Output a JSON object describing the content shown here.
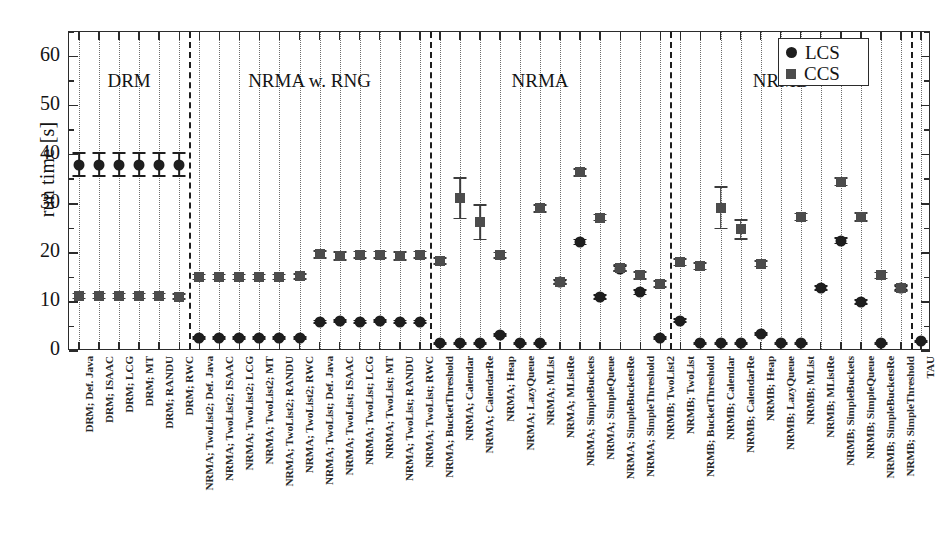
{
  "chart_data": {
    "type": "scatter",
    "title": "",
    "xlabel": "",
    "ylabel": "run time [s]",
    "ylim": [
      0,
      65
    ],
    "ytick_values": [
      0,
      10,
      20,
      30,
      40,
      50,
      60
    ],
    "ytick_labels": [
      "0",
      "10",
      "20",
      "30",
      "40",
      "50",
      "60"
    ],
    "yminor_step": 5,
    "grid": "vertical dotted per category",
    "legend_position": "top right",
    "legend": [
      {
        "name": "LCS",
        "marker": "circle",
        "color": "#1e1e1e"
      },
      {
        "name": "CCS",
        "marker": "square",
        "color": "#4c4c4c"
      }
    ],
    "group_labels": [
      "DRM",
      "NRMA w. RNG",
      "NRMA",
      "NRMB"
    ],
    "group_separator_after_index": [
      5,
      17,
      29
    ],
    "categories": [
      "DRM; Def. Java",
      "DRM; ISAAC",
      "DRM; LCG",
      "DRM; MT",
      "DRM; RANDU",
      "DRM; RWC",
      "NRMA; TwoList2; Def. Java",
      "NRMA; TwoList2; ISAAC",
      "NRMA; TwoList2; LCG",
      "NRMA; TwoList2; MT",
      "NRMA; TwoList2; RANDU",
      "NRMA; TwoList2; RWC",
      "NRMA; TwoList; Def. Java",
      "NRMA; TwoList; ISAAC",
      "NRMA; TwoList; LCG",
      "NRMA; TwoList; MT",
      "NRMA; TwoList; RANDU",
      "NRMA; TwoList; RWC",
      "NRMA; BucketThreshold",
      "NRMA; Calendar",
      "NRMA; CalendarRe",
      "NRMA; Heap",
      "NRMA; LazyQueue",
      "NRMA; MList",
      "NRMA; MListRe",
      "NRMA; SimpleBuckets",
      "NRMA; SimpleQueue",
      "NRMA; SimpleBucketsRe",
      "NRMA; SimpleThreshold",
      "NRMB; TwoList2",
      "NRMB; TwoList",
      "NRMB; BucketThreshold",
      "NRMB; Calendar",
      "NRMB; CalendarRe",
      "NRMB; Heap",
      "NRMB; LazyQueue",
      "NRMB; MList",
      "NRMB; MListRe",
      "NRMB; SimpleBuckets",
      "NRMB; SimpleQueue",
      "NRMB; SimpleBucketsRe",
      "NRMB; SimpleThreshold",
      "TAU"
    ],
    "series": [
      {
        "name": "LCS",
        "marker": "circle",
        "values": [
          38,
          38,
          38,
          38,
          38,
          38,
          2.6,
          2.6,
          2.6,
          2.6,
          2.6,
          2.6,
          6.0,
          6.1,
          6.0,
          6.1,
          6.0,
          6.0,
          1.6,
          1.6,
          1.6,
          3.3,
          1.6,
          1.6,
          14.1,
          22.2,
          11.0,
          16.8,
          12.0,
          2.7,
          6.2,
          1.6,
          1.6,
          1.6,
          3.5,
          1.6,
          1.6,
          12.9,
          22.5,
          10.0,
          1.6,
          12.8,
          2.0
        ],
        "errors": [
          2.3,
          2.3,
          2.3,
          2.3,
          2.3,
          2.3,
          0.2,
          0.2,
          0.2,
          0.2,
          0.2,
          0.2,
          0.25,
          0.25,
          0.25,
          0.25,
          0.25,
          0.25,
          0.15,
          0.15,
          0.15,
          0.2,
          0.15,
          0.15,
          0.4,
          0.5,
          0.35,
          0.5,
          0.5,
          0.2,
          0.3,
          0.15,
          0.15,
          0.15,
          0.2,
          0.15,
          0.15,
          0.4,
          0.6,
          0.4,
          0.15,
          0.4,
          0.15
        ]
      },
      {
        "name": "CCS",
        "marker": "square",
        "values": [
          11.2,
          11.2,
          11.2,
          11.2,
          11.2,
          11.1,
          15.1,
          15.1,
          15.1,
          15.1,
          15.1,
          15.2,
          19.7,
          19.4,
          19.6,
          19.6,
          19.4,
          19.6,
          18.4,
          31.1,
          26.2,
          19.5,
          null,
          29.1,
          14.1,
          36.4,
          27.2,
          16.9,
          15.4,
          13.7,
          18.1,
          17.3,
          29.2,
          24.8,
          17.8,
          null,
          27.3,
          null,
          34.5,
          27.3,
          15.4,
          12.9,
          null
        ],
        "errors": [
          0.5,
          0.5,
          0.5,
          0.5,
          0.5,
          0.5,
          0.5,
          0.5,
          0.5,
          0.5,
          0.5,
          0.5,
          0.7,
          0.8,
          0.7,
          0.7,
          0.8,
          0.7,
          0.6,
          4.1,
          3.5,
          0.6,
          null,
          0.7,
          0.5,
          0.7,
          0.6,
          0.6,
          0.7,
          0.6,
          0.7,
          0.7,
          4.2,
          1.9,
          0.6,
          null,
          0.7,
          null,
          0.8,
          0.8,
          0.6,
          0.6,
          null
        ]
      }
    ]
  },
  "axis": {
    "y_title": "run time [s]",
    "y_tick_0": "0",
    "y_tick_10": "10",
    "y_tick_20": "20",
    "y_tick_30": "30",
    "y_tick_40": "40",
    "y_tick_50": "50",
    "y_tick_60": "60"
  },
  "legend": {
    "lcs_label": "LCS",
    "ccs_label": "CCS"
  },
  "groups": {
    "g0": "DRM",
    "g1": "NRMA w. RNG",
    "g2": "NRMA",
    "g3": "NRMB"
  }
}
